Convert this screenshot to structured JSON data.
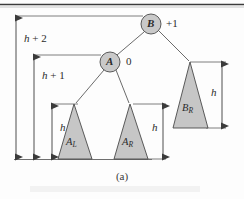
{
  "figure": {
    "caption": "(a)",
    "top_rule": true,
    "nodes": [
      {
        "id": "B",
        "label": "B",
        "balance": "+1",
        "cx": 151,
        "cy": 24,
        "r": 10
      },
      {
        "id": "A",
        "label": "A",
        "balance": "0",
        "cx": 110,
        "cy": 62,
        "r": 10
      }
    ],
    "subtrees": [
      {
        "id": "A_L",
        "label": "A",
        "sub": "L",
        "apex_x": 74,
        "apex_y": 104,
        "base_left": 58,
        "base_right": 92,
        "base_y": 159
      },
      {
        "id": "A_R",
        "label": "A",
        "sub": "R",
        "apex_x": 130,
        "apex_y": 104,
        "base_left": 114,
        "base_right": 148,
        "base_y": 159
      },
      {
        "id": "B_R",
        "label": "B",
        "sub": "R",
        "apex_x": 190,
        "apex_y": 62,
        "base_left": 173,
        "base_right": 208,
        "base_y": 128
      }
    ],
    "measures": [
      {
        "id": "h-plus-2",
        "label": "h + 2",
        "text_main": "h",
        "text_rest": " + 2",
        "x": 16,
        "y_top": 16,
        "y_bottom": 159,
        "label_x": 24,
        "label_y": 40
      },
      {
        "id": "h-plus-1",
        "label": "h + 1",
        "text_main": "h",
        "text_rest": " + 1",
        "x": 34,
        "y_top": 55,
        "y_bottom": 159,
        "label_x": 42,
        "label_y": 76
      },
      {
        "id": "h-left",
        "label": "h",
        "text_main": "h",
        "text_rest": "",
        "x": 52,
        "y_top": 104,
        "y_bottom": 159,
        "label_x": 60,
        "label_y": 128
      },
      {
        "id": "h-middle",
        "label": "h",
        "text_main": "h",
        "text_rest": "",
        "x": 163,
        "y_top": 104,
        "y_bottom": 159,
        "label_x": 153,
        "label_y": 128
      },
      {
        "id": "h-right",
        "label": "h",
        "text_main": "h",
        "text_rest": "",
        "x": 222,
        "y_top": 62,
        "y_bottom": 128,
        "label_x": 212,
        "label_y": 92
      }
    ],
    "colors": {
      "node_fill": "#c9c9c9",
      "triangle_fill": "#c6c6c6",
      "stroke": "#4a4a4a",
      "rule": "#3c3c3c",
      "text": "#2b2b2b"
    }
  }
}
